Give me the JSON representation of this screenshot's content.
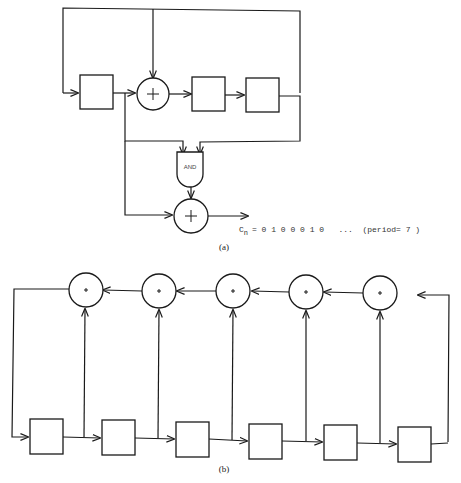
{
  "figure": {
    "diagram_a": {
      "caption": "(a)",
      "registers": 3,
      "gate_label": "AND",
      "xor_symbol": "+",
      "output_label_main": "C",
      "output_label_sub": "n",
      "output_sequence": "= 0 1 0 0 0 1 0   ...  (period= 7 )"
    },
    "diagram_b": {
      "caption": "(b)",
      "registers": 6,
      "xor_adders": 5,
      "xor_symbol": "+"
    }
  },
  "colors": {
    "ink": "#1a1a1a",
    "background": "#ffffff"
  }
}
